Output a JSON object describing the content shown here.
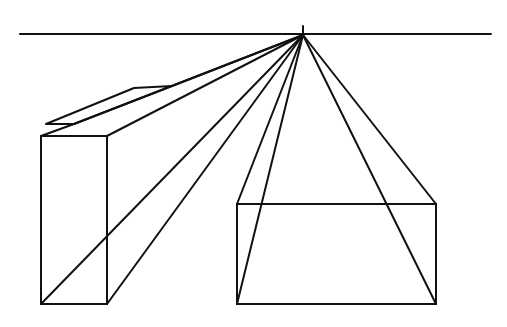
{
  "diagram": {
    "colors": {
      "background": "#ffffff",
      "stroke": "#111111"
    },
    "horizon_line": {
      "x1": 20,
      "y1": 34,
      "x2": 491,
      "y2": 34
    },
    "vanishing_point": {
      "x": 303,
      "y": 35,
      "tick_top": 26
    },
    "left_box": {
      "front_face": {
        "x": 41,
        "y": 136,
        "width": 66,
        "height": 168
      }
    },
    "plate": {
      "points": "46,124 134,87 172,86 160,89 74,124"
    },
    "right_box": {
      "front_face": {
        "x": 237,
        "y": 204,
        "width": 199,
        "height": 100
      }
    }
  }
}
